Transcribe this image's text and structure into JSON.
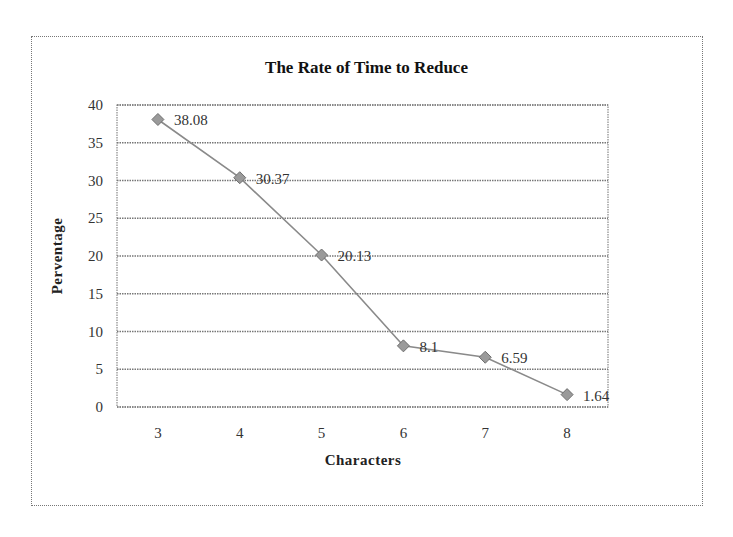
{
  "chart_data": {
    "type": "line",
    "title": "The Rate of Time to Reduce",
    "xlabel": "Characters",
    "ylabel": "Perventage",
    "categories": [
      "3",
      "4",
      "5",
      "6",
      "7",
      "8"
    ],
    "x": [
      3,
      4,
      5,
      6,
      7,
      8
    ],
    "series": [
      {
        "name": "Rate of Time to Reduce",
        "values": [
          38.08,
          30.37,
          20.13,
          8.1,
          6.59,
          1.64
        ],
        "data_labels": [
          "38.08",
          "30.37",
          "20.13",
          "8.1",
          "6.59",
          "1.64"
        ],
        "marker": "diamond",
        "color": "#808080"
      }
    ],
    "ylim": [
      0,
      40
    ],
    "yticks": [
      0,
      5,
      10,
      15,
      20,
      25,
      30,
      35,
      40
    ],
    "grid": {
      "horizontal": true,
      "vertical": false,
      "style": "dotted"
    },
    "legend": null
  }
}
